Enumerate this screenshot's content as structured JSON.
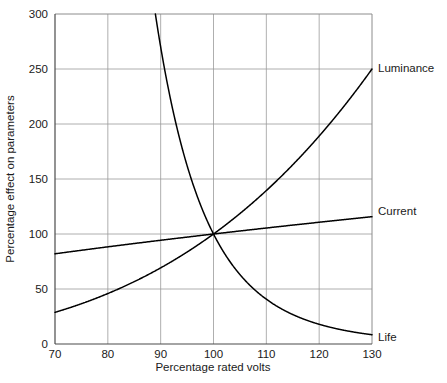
{
  "chart_data": {
    "type": "line",
    "title": "",
    "xlabel": "Percentage rated volts",
    "ylabel": "Percentage effect on parameters",
    "xlim": [
      70,
      130
    ],
    "ylim": [
      0,
      300
    ],
    "xticks": [
      70,
      80,
      90,
      100,
      110,
      120,
      130
    ],
    "yticks": [
      0,
      50,
      100,
      150,
      200,
      250,
      300
    ],
    "grid": true,
    "legend_position": "right-of-plot-end-labels",
    "x": [
      70,
      75,
      80,
      85,
      90,
      95,
      100,
      105,
      110,
      115,
      120,
      125,
      130
    ],
    "series": [
      {
        "name": "Life",
        "label": "Life",
        "values": [
          1400,
          820,
          470,
          300,
          300,
          185,
          100,
          52,
          30,
          18,
          10,
          5,
          2
        ],
        "note": "Steep decaying curve; exits top of plot near 89% volts, crosses 100% at value 100, approaches 0 by 130%",
        "color": "#000000"
      },
      {
        "name": "Luminance",
        "label": "Luminance",
        "values": [
          25,
          34,
          44,
          56,
          68,
          83,
          100,
          120,
          143,
          170,
          199,
          223,
          250
        ],
        "note": "Rising curve from 25 at 70% volts to 250 at 130% volts, passing through 100 at 100%",
        "color": "#000000"
      },
      {
        "name": "Current",
        "label": "Current",
        "values": [
          82,
          85,
          88,
          91,
          94,
          97,
          100,
          103,
          106,
          109,
          112,
          115,
          118
        ],
        "note": "Nearly straight gentle rise from 82 at 70% volts to about 118 at 130% volts",
        "color": "#000000"
      }
    ],
    "colors": {
      "curve": "#000000",
      "grid": "#9a9a9a",
      "axis": "#4a4a4a",
      "background": "#ffffff",
      "text": "#1a1a1a"
    }
  },
  "axis": {
    "x_tick_labels": [
      "70",
      "80",
      "90",
      "100",
      "110",
      "120",
      "130"
    ],
    "y_tick_labels": [
      "0",
      "50",
      "100",
      "150",
      "200",
      "250",
      "300"
    ],
    "x_title": "Percentage rated volts",
    "y_title": "Percentage effect on parameters"
  },
  "series_labels": {
    "luminance": "Luminance",
    "current": "Current",
    "life": "Life"
  }
}
